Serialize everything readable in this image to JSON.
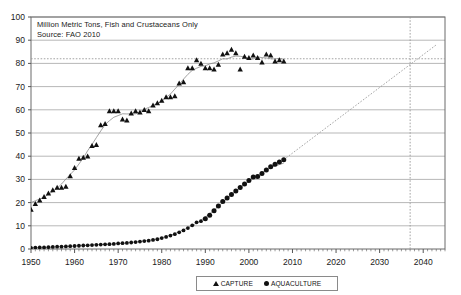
{
  "annotation": {
    "line1": "Million Metric Tons,   Fish and Crustaceans Only",
    "line2": "Source:  FAO 2010"
  },
  "legend": {
    "capture_label": "CAPTURE",
    "aquaculture_label": "AQUACULTURE",
    "capture_marker": "triangle-marker-icon",
    "aquaculture_marker": "circle-marker-icon"
  },
  "colors": {
    "marker": "#111111",
    "gridline": "#9a9a9a",
    "axis": "#555555",
    "trendline": "#8c8c8c",
    "projection": "#9a9a9a",
    "text": "#1a1a1a",
    "background": "#ffffff"
  },
  "chart_data": {
    "type": "scatter",
    "title": "",
    "xlabel": "",
    "ylabel": "Million Metric Tons",
    "xlim": [
      1950,
      2045
    ],
    "ylim": [
      0,
      100
    ],
    "xticks": [
      1950,
      1960,
      1970,
      1980,
      1990,
      2000,
      2010,
      2020,
      2030,
      2040
    ],
    "yticks": [
      0,
      10,
      20,
      30,
      40,
      50,
      60,
      70,
      80,
      90,
      100
    ],
    "grid": true,
    "legend_position": "bottom",
    "annotations": [
      {
        "text": "Million Metric Tons,   Fish and Crustaceans Only",
        "x": 1951,
        "y": 92
      },
      {
        "text": "Source:  FAO 2010",
        "x": 1951,
        "y": 88
      }
    ],
    "reference_lines": [
      {
        "name": "capture-plateau-level",
        "type": "horizontal",
        "y": 82,
        "style": "dotted"
      },
      {
        "name": "crossover-year",
        "type": "vertical",
        "x": 2037,
        "style": "dotted"
      }
    ],
    "series": [
      {
        "name": "CAPTURE",
        "marker": "triangle",
        "x": [
          1950,
          1951,
          1952,
          1953,
          1954,
          1955,
          1956,
          1957,
          1958,
          1959,
          1960,
          1961,
          1962,
          1963,
          1964,
          1965,
          1966,
          1967,
          1968,
          1969,
          1970,
          1971,
          1972,
          1973,
          1974,
          1975,
          1976,
          1977,
          1978,
          1979,
          1980,
          1981,
          1982,
          1983,
          1984,
          1985,
          1986,
          1987,
          1988,
          1989,
          1990,
          1991,
          1992,
          1993,
          1994,
          1995,
          1996,
          1997,
          1998,
          1999,
          2000,
          2001,
          2002,
          2003,
          2004,
          2005,
          2006,
          2007,
          2008
        ],
        "values": [
          17,
          19.5,
          21,
          22.5,
          24,
          25.5,
          26.5,
          26.5,
          27,
          31.5,
          35,
          39,
          39.5,
          40,
          44.5,
          45,
          53.5,
          54,
          59.5,
          59.5,
          59.5,
          56,
          55.5,
          58.5,
          59.5,
          59,
          60,
          59.5,
          62,
          63,
          64,
          65.5,
          65.5,
          66,
          71.5,
          72,
          78,
          78,
          81.5,
          80,
          78,
          78,
          77.5,
          79.5,
          84,
          84.5,
          86,
          84.5,
          77.5,
          83,
          82.5,
          83.5,
          82.5,
          80.5,
          84,
          83.5,
          81,
          81.5,
          81
        ],
        "trendline": {
          "type": "fitted-curve",
          "description": "rising then plateau"
        }
      },
      {
        "name": "AQUACULTURE",
        "marker": "circle",
        "x": [
          1950,
          1951,
          1952,
          1953,
          1954,
          1955,
          1956,
          1957,
          1958,
          1959,
          1960,
          1961,
          1962,
          1963,
          1964,
          1965,
          1966,
          1967,
          1968,
          1969,
          1970,
          1971,
          1972,
          1973,
          1974,
          1975,
          1976,
          1977,
          1978,
          1979,
          1980,
          1981,
          1982,
          1983,
          1984,
          1985,
          1986,
          1987,
          1988,
          1989,
          1990,
          1991,
          1992,
          1993,
          1994,
          1995,
          1996,
          1997,
          1998,
          1999,
          2000,
          2001,
          2002,
          2003,
          2004,
          2005,
          2006,
          2007,
          2008
        ],
        "values": [
          0.5,
          0.6,
          0.7,
          0.7,
          0.8,
          0.9,
          1.0,
          1.0,
          1.1,
          1.2,
          1.3,
          1.4,
          1.5,
          1.6,
          1.7,
          1.8,
          1.9,
          2.0,
          2.1,
          2.2,
          2.4,
          2.5,
          2.6,
          2.8,
          3.0,
          3.2,
          3.4,
          3.6,
          3.9,
          4.2,
          4.7,
          5.2,
          5.8,
          6.4,
          7.2,
          8.0,
          9.0,
          10.2,
          11.5,
          12.0,
          13.0,
          14.5,
          16.5,
          18.5,
          20.5,
          22.0,
          23.5,
          25.0,
          26.5,
          28.0,
          29.5,
          31.0,
          31.2,
          32.5,
          34.0,
          35.5,
          36.5,
          37.5,
          38.5
        ],
        "trendline": {
          "type": "fitted-curve",
          "description": "exponential growth"
        },
        "projection": {
          "style": "dotted",
          "from": [
            2008,
            38.5
          ],
          "to": [
            2043,
            88
          ],
          "crosses_capture_at": {
            "x": 2037,
            "y": 82
          }
        }
      }
    ]
  }
}
